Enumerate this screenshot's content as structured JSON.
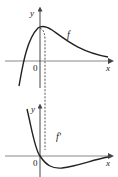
{
  "figure": {
    "top_graph": {
      "curve_label": "f",
      "x_axis_label": "x",
      "y_axis_label": "y",
      "origin_label": "0"
    },
    "bottom_graph": {
      "curve_label": "f'",
      "x_axis_label": "x",
      "y_axis_label": "y",
      "origin_label": "0"
    },
    "colors": {
      "axis": "#7a7a7a",
      "curve": "#222222",
      "dashed": "#444444"
    }
  }
}
